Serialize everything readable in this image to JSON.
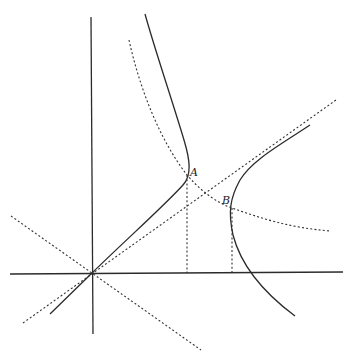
{
  "figure": {
    "type": "geometric-diagram",
    "points": [
      {
        "label": "A",
        "x": 187,
        "y": 175
      },
      {
        "label": "B",
        "x": 232,
        "y": 208
      }
    ],
    "origin": {
      "x": 92,
      "y": 273
    },
    "colors": {
      "line": "#2b2b2b",
      "background": "#ffffff"
    }
  },
  "labels": {
    "point_a": "A",
    "point_b": "B"
  }
}
